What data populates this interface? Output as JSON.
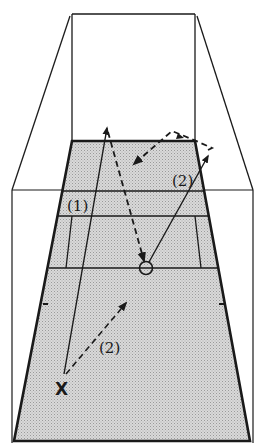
{
  "diagram": {
    "colors": {
      "ink": "#1a1a1a",
      "court_fill": "#cfcfcf",
      "background": "#ffffff"
    },
    "labels": {
      "shot1": "(1)",
      "shot2_upper": "(2)",
      "shot2_lower": "(2)",
      "player": "X"
    },
    "elements": {
      "player_marker": "X",
      "target_marker": "circle",
      "shot_1": "solid line from player to back wall",
      "shot_2": "dashed line from player, then solid to side wall, dashed rebound",
      "return_path": "dashed line from back area down to circle"
    }
  }
}
